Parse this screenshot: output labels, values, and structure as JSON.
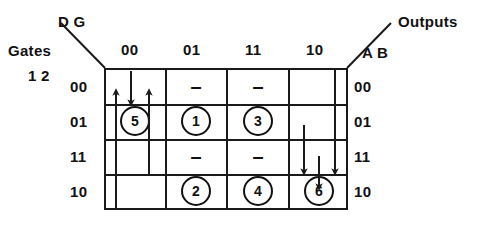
{
  "figure": {
    "type": "karnaugh-map-transition-diagram",
    "corner_top_left": {
      "col_var_label": "D G",
      "row_group_label": "Gates",
      "row_var_label": "1 2"
    },
    "corner_top_right": {
      "label": "Outputs",
      "var_label": "A B"
    },
    "column_headers": [
      "00",
      "01",
      "11",
      "10"
    ],
    "row_headers": [
      "00",
      "01",
      "11",
      "10"
    ],
    "right_row_labels": [
      "00",
      "01",
      "11",
      "10"
    ],
    "cells": [
      [
        {
          "row": "00",
          "col": "00",
          "content": ""
        },
        {
          "row": "00",
          "col": "01",
          "content": "–"
        },
        {
          "row": "00",
          "col": "11",
          "content": "–"
        },
        {
          "row": "00",
          "col": "10",
          "content": ""
        }
      ],
      [
        {
          "row": "01",
          "col": "00",
          "content": "5"
        },
        {
          "row": "01",
          "col": "01",
          "content": "1"
        },
        {
          "row": "01",
          "col": "11",
          "content": "3"
        },
        {
          "row": "01",
          "col": "10",
          "content": ""
        }
      ],
      [
        {
          "row": "11",
          "col": "00",
          "content": ""
        },
        {
          "row": "11",
          "col": "01",
          "content": "–"
        },
        {
          "row": "11",
          "col": "11",
          "content": "–"
        },
        {
          "row": "11",
          "col": "10",
          "content": ""
        }
      ],
      [
        {
          "row": "10",
          "col": "00",
          "content": ""
        },
        {
          "row": "10",
          "col": "01",
          "content": "2"
        },
        {
          "row": "10",
          "col": "11",
          "content": "4"
        },
        {
          "row": "10",
          "col": "10",
          "content": "6"
        }
      ]
    ],
    "circled_states": [
      "5",
      "1",
      "3",
      "2",
      "4",
      "6"
    ],
    "dont_care_marks": 4,
    "transitions": [
      {
        "id": "t1",
        "direction": "up",
        "column": "00",
        "from_row": "10",
        "to_row": "01"
      },
      {
        "id": "t2",
        "direction": "down",
        "column": "00",
        "from_row": "00",
        "to_row": "01"
      },
      {
        "id": "t3",
        "direction": "up",
        "column": "00",
        "from_row": "11",
        "to_row": "01"
      },
      {
        "id": "t4",
        "direction": "down",
        "column": "10",
        "from_row": "01",
        "to_row": "11"
      },
      {
        "id": "t5",
        "direction": "down",
        "column": "10",
        "from_row": "00",
        "to_row": "11"
      },
      {
        "id": "t6",
        "direction": "down",
        "column": "10",
        "from_row": "11",
        "to_row": "10"
      }
    ],
    "colors": {
      "line": "#1a1a1a",
      "text": "#111111",
      "background": "#ffffff"
    }
  }
}
